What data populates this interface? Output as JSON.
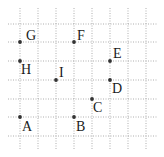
{
  "grid": {
    "x_lines": [
      20,
      38,
      56,
      74,
      92,
      110,
      128,
      146
    ],
    "y_lines": [
      24,
      42,
      61,
      80,
      99,
      117,
      136
    ],
    "x_extent": [
      8,
      158
    ],
    "y_extent": [
      8,
      150
    ],
    "line_color": "#9a9a9a"
  },
  "points": [
    {
      "label": "G",
      "x": 20,
      "y": 42,
      "lx": 26,
      "ly": 40
    },
    {
      "label": "F",
      "x": 74,
      "y": 42,
      "lx": 77,
      "ly": 40
    },
    {
      "label": "E",
      "x": 110,
      "y": 61,
      "lx": 113,
      "ly": 58
    },
    {
      "label": "H",
      "x": 20,
      "y": 61,
      "lx": 21,
      "ly": 74
    },
    {
      "label": "I",
      "x": 56,
      "y": 80,
      "lx": 59,
      "ly": 77
    },
    {
      "label": "D",
      "x": 110,
      "y": 80,
      "lx": 112,
      "ly": 93
    },
    {
      "label": "C",
      "x": 92,
      "y": 99,
      "lx": 93,
      "ly": 112
    },
    {
      "label": "A",
      "x": 20,
      "y": 117,
      "lx": 22,
      "ly": 131
    },
    {
      "label": "B",
      "x": 74,
      "y": 117,
      "lx": 76,
      "ly": 131
    }
  ],
  "point_color": "#333333"
}
